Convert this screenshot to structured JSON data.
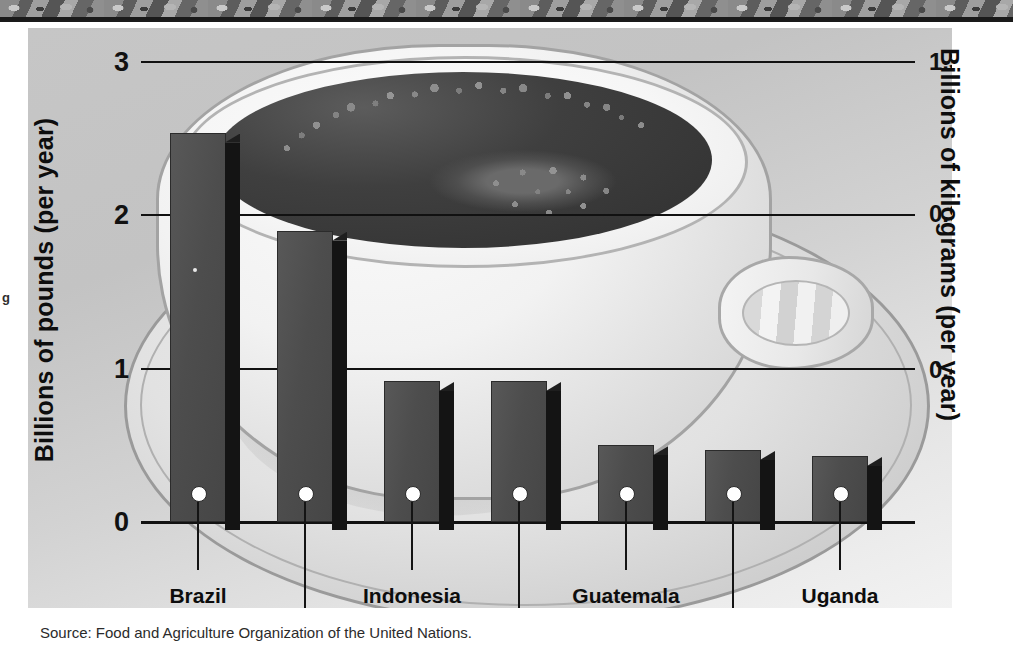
{
  "decor": {
    "top_band_name": "decorative-pattern-band",
    "side_glyph": "g"
  },
  "source": {
    "text": "Source: Food and Agriculture Organization of the United Nations."
  },
  "axes": {
    "left_title": "Billions of pounds (per year)",
    "right_title": "Billions of kilograms (per year)",
    "left_ticks": [
      "3",
      "2",
      "1",
      "0"
    ],
    "right_ticks": [
      "1.36",
      "0.91",
      "0.45"
    ]
  },
  "colors": {
    "panel_background": "#c9c9c9",
    "bar_face": "#4d4d4d",
    "bar_shadow": "#141414",
    "gridline": "#111111",
    "text": "#0d0d0d",
    "coffee": "#3f3f3f",
    "cup": "#f2f2f2"
  },
  "chart_data": {
    "type": "bar",
    "title": "",
    "subtitle": "",
    "categories": [
      "Brazil",
      "Colombia",
      "Indonesia",
      "Mexico",
      "Guatemala",
      "Ethiopia",
      "Uganda"
    ],
    "values": [
      2.54,
      1.9,
      0.92,
      0.92,
      0.5,
      0.47,
      0.43
    ],
    "secondary_values": [
      1.15,
      0.86,
      0.42,
      0.42,
      0.23,
      0.21,
      0.2
    ],
    "xlabel": "",
    "ylabel": "Billions of pounds (per year)",
    "ylabel_secondary": "Billions of kilograms (per year)",
    "ylim": [
      0,
      3
    ],
    "yticks": [
      0,
      1,
      2,
      3
    ],
    "ytick_labels": [
      "0",
      "1",
      "2",
      "3"
    ],
    "ylim_secondary": [
      0,
      1.36
    ],
    "yticks_secondary": [
      0.45,
      0.91,
      1.36
    ],
    "ytick_labels_secondary": [
      "0.45",
      "0.91",
      "1.36"
    ],
    "grid": true,
    "legend": "none",
    "annotations": [
      "Source: Food and Agriculture Organization of the United Nations."
    ]
  }
}
